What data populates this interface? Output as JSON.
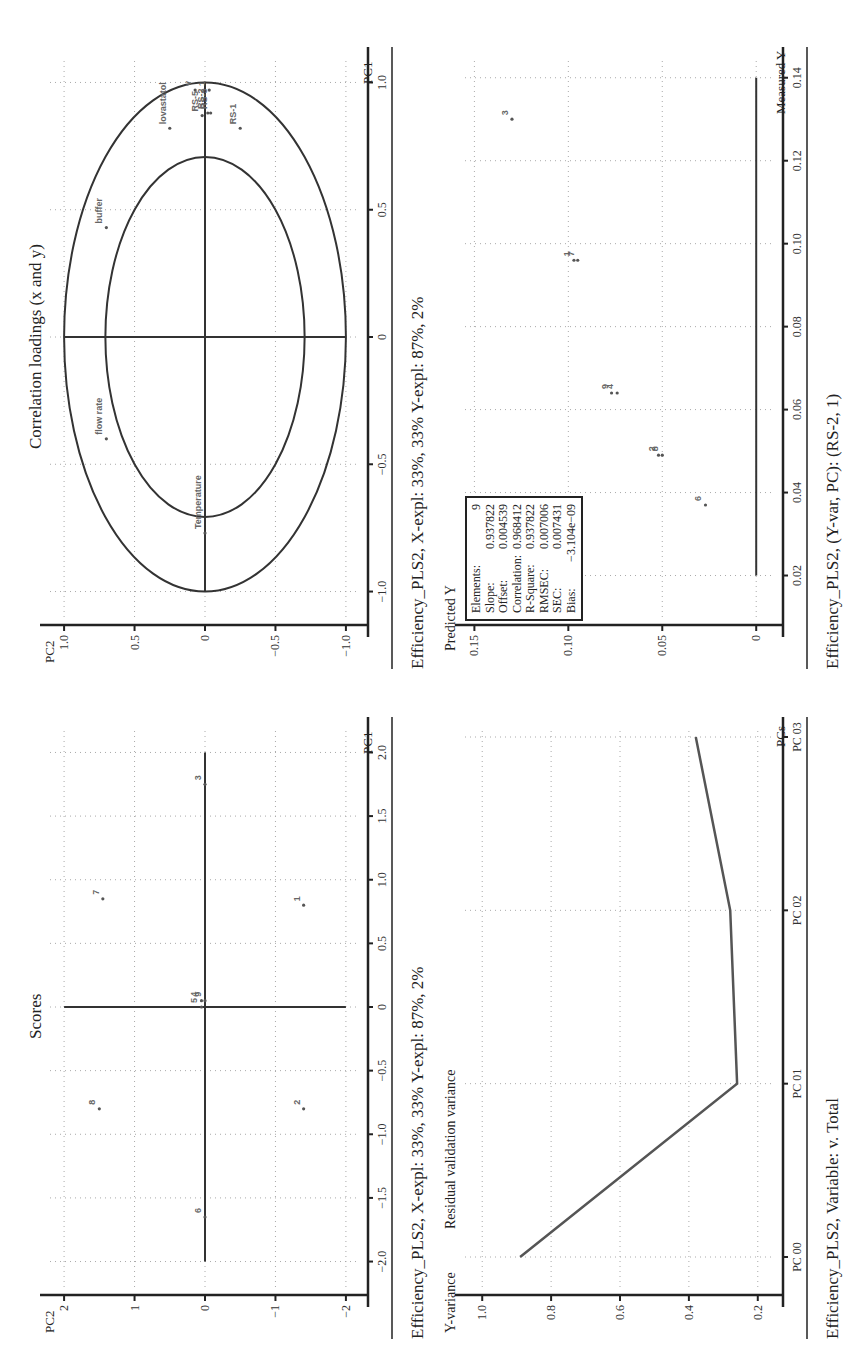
{
  "chart_data": [
    {
      "id": "scores",
      "type": "scatter",
      "title": "Scores",
      "xlabel": "PC1",
      "ylabel": "PC2",
      "xlim": [
        -2.2,
        2.2
      ],
      "ylim": [
        -2.2,
        2.2
      ],
      "xticks": [
        -2.0,
        -1.5,
        -1.0,
        -0.5,
        0,
        0.5,
        1.0,
        1.5,
        2.0
      ],
      "xtick_labels": [
        "−2.0",
        "−1.5",
        "−1.0",
        "−0.5",
        "0",
        "0.5",
        "1.0",
        "1.5",
        "2.0"
      ],
      "yticks": [
        2,
        1,
        0,
        -1,
        -2
      ],
      "ytick_labels": [
        "2",
        "1",
        "0",
        "−1",
        "−2"
      ],
      "grid": true,
      "points": [
        {
          "label": "8",
          "x": -0.8,
          "y": 1.5
        },
        {
          "label": "7",
          "x": 0.85,
          "y": 1.45
        },
        {
          "label": "2",
          "x": -0.8,
          "y": -1.4
        },
        {
          "label": "1",
          "x": 0.8,
          "y": -1.4
        },
        {
          "label": "6",
          "x": -1.65,
          "y": 0.0
        },
        {
          "label": "5",
          "x": 0.0,
          "y": 0.05
        },
        {
          "label": "4",
          "x": 0.05,
          "y": 0.05
        },
        {
          "label": "3",
          "x": 1.75,
          "y": 0.0
        },
        {
          "label": "9",
          "x": 0.05,
          "y": 0.0
        }
      ],
      "caption": "Efficiency_PLS2, X-expl: 33%, 33% Y-expl: 87%, 2%"
    },
    {
      "id": "correlation_loadings",
      "type": "scatter",
      "title": "Correlation loadings (x and y)",
      "xlabel": "PC1",
      "ylabel": "PC2",
      "xlim": [
        -1.1,
        1.1
      ],
      "ylim": [
        -1.1,
        1.1
      ],
      "xticks": [
        -1.0,
        -0.5,
        0,
        0.5,
        1.0
      ],
      "xtick_labels": [
        "−1.0",
        "−0.5",
        "0",
        "0.5",
        "1.0"
      ],
      "yticks": [
        1.0,
        0.5,
        0,
        -0.5,
        -1.0
      ],
      "ytick_labels": [
        "1.0",
        "0.5",
        "0",
        "−0.5",
        "−1.0"
      ],
      "grid": true,
      "circles": [
        0.707,
        1.0
      ],
      "points": [
        {
          "label": "lovastatol",
          "x": 0.82,
          "y": 0.25
        },
        {
          "label": "buffer",
          "x": 0.43,
          "y": 0.7
        },
        {
          "label": "flow rate",
          "x": -0.4,
          "y": 0.7
        },
        {
          "label": "Temperature",
          "x": -0.77,
          "y": 0.0
        },
        {
          "label": "RS-5",
          "x": 0.87,
          "y": 0.02
        },
        {
          "label": "RS-2",
          "x": 0.88,
          "y": -0.02
        },
        {
          "label": "RS-3",
          "x": 0.88,
          "y": -0.04
        },
        {
          "label": "RS-1",
          "x": 0.82,
          "y": -0.25
        },
        {
          "label": "v",
          "x": 0.97,
          "y": 0.07
        },
        {
          "label": "1",
          "x": 0.97,
          "y": -0.03
        }
      ],
      "caption": "Efficiency_PLS2, X-expl: 33%, 33% Y-expl: 87%, 2%"
    },
    {
      "id": "residual_validation_variance",
      "type": "line",
      "title": "Residual validation variance",
      "xlabel": "PCs",
      "ylabel": "Y-variance",
      "categories": [
        "PC 00",
        "PC 01",
        "PC 02",
        "PC 03"
      ],
      "series": [
        {
          "name": "Total",
          "values": [
            0.89,
            0.26,
            0.28,
            0.38
          ]
        }
      ],
      "ylim": [
        0.15,
        1.05
      ],
      "yticks": [
        1.0,
        0.8,
        0.6,
        0.4,
        0.2
      ],
      "ytick_labels": [
        "1.0",
        "0.8",
        "0.6",
        "0.4",
        "0.2"
      ],
      "grid": true,
      "caption": "Efficiency_PLS2, Variable: v. Total"
    },
    {
      "id": "predicted_vs_measured",
      "type": "scatter",
      "title": "",
      "xlabel": "Measured Y",
      "ylabel": "Predicted Y",
      "xlim": [
        0.01,
        0.145
      ],
      "ylim": [
        -0.01,
        0.155
      ],
      "xticks": [
        0.02,
        0.04,
        0.06,
        0.08,
        0.1,
        0.12,
        0.14
      ],
      "xtick_labels": [
        "0.02",
        "0.04",
        "0.06",
        "0.08",
        "0.10",
        "0.12",
        "0.14"
      ],
      "yticks": [
        0.15,
        0.1,
        0.05,
        0
      ],
      "ytick_labels": [
        "0.15",
        "0.10",
        "0.05",
        "0"
      ],
      "grid": true,
      "points": [
        {
          "label": "6",
          "x": 0.037,
          "y": 0.027
        },
        {
          "label": "8",
          "x": 0.049,
          "y": 0.05
        },
        {
          "label": "2",
          "x": 0.049,
          "y": 0.052
        },
        {
          "label": "4",
          "x": 0.064,
          "y": 0.074
        },
        {
          "label": "9",
          "x": 0.064,
          "y": 0.077
        },
        {
          "label": "7",
          "x": 0.096,
          "y": 0.095
        },
        {
          "label": "1",
          "x": 0.096,
          "y": 0.097
        },
        {
          "label": "3",
          "x": 0.13,
          "y": 0.13
        }
      ],
      "stats": [
        {
          "label": "Elements:",
          "value": "9"
        },
        {
          "label": "Slope:",
          "value": "0.937822"
        },
        {
          "label": "Offset:",
          "value": "0.004539"
        },
        {
          "label": "Correlation:",
          "value": "0.968412"
        },
        {
          "label": "R-Square:",
          "value": "0.937822"
        },
        {
          "label": "RMSEC:",
          "value": "0.007006"
        },
        {
          "label": "SEC:",
          "value": "0.007431"
        },
        {
          "label": "Bias:",
          "value": "−3.104e−09"
        }
      ],
      "caption": "Efficiency_PLS2, (Y-var, PC): (RS-2, 1)"
    }
  ],
  "panels": {
    "scores": {
      "title": "Scores",
      "xlabel": "PC1",
      "ylabel": "PC2",
      "caption": "Efficiency_PLS2, X-expl: 33%, 33% Y-expl: 87%, 2%"
    },
    "loadings": {
      "title": "Correlation loadings (x and y)",
      "xlabel": "PC1",
      "ylabel": "PC2",
      "caption": "Efficiency_PLS2, X-expl: 33%, 33% Y-expl: 87%, 2%"
    },
    "variance": {
      "title": "Residual validation variance",
      "xlabel": "PCs",
      "ylabel": "Y-variance",
      "caption": "Efficiency_PLS2, Variable: v. Total"
    },
    "predicted": {
      "xlabel": "Measured Y",
      "ylabel": "Predicted Y",
      "caption": "Efficiency_PLS2, (Y-var, PC): (RS-2, 1)"
    }
  }
}
